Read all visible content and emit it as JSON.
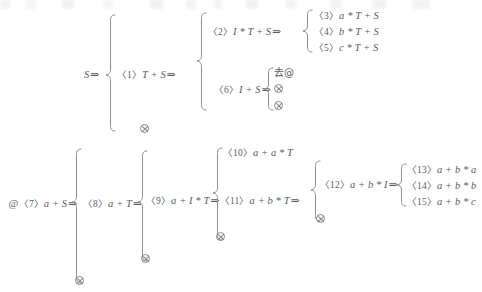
{
  "figure": {
    "ink_color": "#5a5b5f",
    "rule_color": "#8d8e92",
    "background": "#ffffff",
    "dead_end_symbol": "circled-times",
    "arrow_symbol": "double-right-arrow"
  },
  "nodes": {
    "root1": {
      "label": "S",
      "arrow": "⇒"
    },
    "n1": {
      "num": "〈1〉",
      "label": "T + S",
      "arrow": "⇒"
    },
    "n2": {
      "num": "〈2〉",
      "label": "I * T + S",
      "arrow": "⇒"
    },
    "n3": {
      "num": "〈3〉",
      "label": "a * T + S",
      "arrow": ""
    },
    "n4": {
      "num": "〈4〉",
      "label": "b * T + S",
      "arrow": ""
    },
    "n5": {
      "num": "〈5〉",
      "label": "c * T + S",
      "arrow": ""
    },
    "n6": {
      "num": "〈6〉",
      "label": "I + S",
      "arrow": "⇒"
    },
    "cjk": {
      "label": "去@"
    },
    "root2": {
      "prefix": "@",
      "num": "〈7〉",
      "label": "a + S",
      "arrow": "⇒"
    },
    "n8": {
      "num": "〈8〉",
      "label": "a + T",
      "arrow": "⇒"
    },
    "n9": {
      "num": "〈9〉",
      "label": "a + I * T",
      "arrow": "⇒"
    },
    "n10": {
      "num": "〈10〉",
      "label": "a + a * T",
      "arrow": ""
    },
    "n11": {
      "num": "〈11〉",
      "label": "a + b * T",
      "arrow": "⇒"
    },
    "n12": {
      "num": "〈12〉",
      "label": "a + b * I",
      "arrow": "⇒"
    },
    "n13": {
      "num": "〈13〉",
      "label": "a + b * a",
      "arrow": ""
    },
    "n14": {
      "num": "〈14〉",
      "label": "a + b * b",
      "arrow": ""
    },
    "n15": {
      "num": "〈15〉",
      "label": "a + b * c",
      "arrow": ""
    }
  },
  "dead_ends": {
    "count": 7,
    "symbol": "⊗"
  }
}
